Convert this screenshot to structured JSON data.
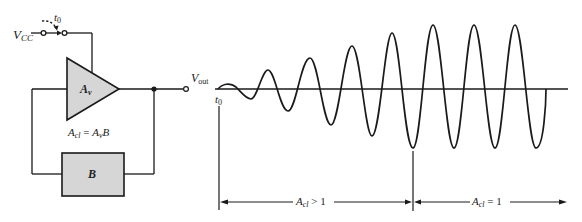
{
  "diagram": {
    "circuit": {
      "supply_label": "V",
      "supply_sub": "CC",
      "switch_time_label": "t",
      "switch_time_sub": "0",
      "amplifier_label": "A",
      "amplifier_sub": "v",
      "feedback_block_label": "B",
      "gain_equation": {
        "lhs": "A",
        "lhs_sub": "cl",
        "eq": " = ",
        "rhs": "A",
        "rhs_sub": "v",
        "rhs_tail": "B"
      },
      "output_label": "V",
      "output_sub": "out"
    },
    "waveform": {
      "start_label": "t",
      "start_sub": "0",
      "region1": {
        "label": "A",
        "sub": "cl",
        "tail": " > 1"
      },
      "region2": {
        "label": "A",
        "sub": "cl",
        "tail": " = 1"
      }
    },
    "colors": {
      "line": "#1a1a1a",
      "fill": "#d6d6d6"
    }
  }
}
